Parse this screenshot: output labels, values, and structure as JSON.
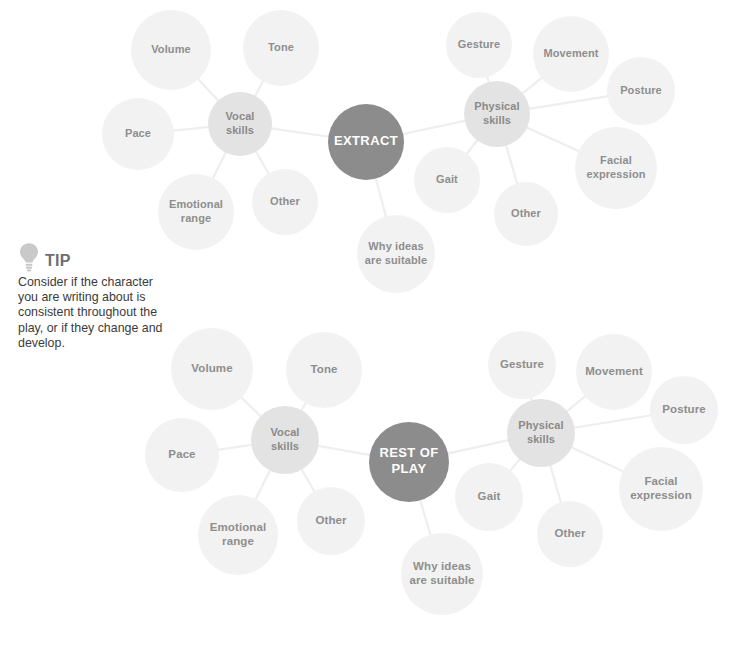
{
  "page": {
    "width": 734,
    "height": 648,
    "background": "#ffffff"
  },
  "colors": {
    "core_node": "#8c8c8c",
    "hub_node": "#e3e3e3",
    "leaf_node": "#f2f2f2",
    "edge_line": "#eeeeee",
    "node_text": "#8e8e8e",
    "core_text": "#ffffff",
    "tip_title": "#6f6f6f",
    "tip_body": "#3b3b3b",
    "tip_bulb": "#c9c9c9"
  },
  "tip": {
    "icon": "lightbulb-icon",
    "title": "TIP",
    "body": "Consider if the character you are writing about is consistent throughout the play, or if they change and develop."
  },
  "diagrams": [
    {
      "id": "extract-map",
      "name": "extract-mind-map",
      "core": {
        "label": "EXTRACT",
        "lines": [
          "EXTRACT"
        ],
        "cx": 366,
        "cy": 142,
        "r": 38,
        "font_size": 13
      },
      "hubs": [
        {
          "id": "vocal-skills-top",
          "label": "Vocal skills",
          "lines": [
            "Vocal",
            "skills"
          ],
          "cx": 240,
          "cy": 124,
          "r": 32,
          "font_size": 11
        },
        {
          "id": "physical-skills-top",
          "label": "Physical skills",
          "lines": [
            "Physical",
            "skills"
          ],
          "cx": 497,
          "cy": 114,
          "r": 33,
          "font_size": 11
        }
      ],
      "leaves": [
        {
          "id": "volume-top",
          "label": "Volume",
          "lines": [
            "Volume"
          ],
          "cx": 171,
          "cy": 50,
          "r": 40,
          "font_size": 11,
          "parent": "vocal-skills-top"
        },
        {
          "id": "tone-top",
          "label": "Tone",
          "lines": [
            "Tone"
          ],
          "cx": 281,
          "cy": 48,
          "r": 38,
          "font_size": 11,
          "parent": "vocal-skills-top"
        },
        {
          "id": "pace-top",
          "label": "Pace",
          "lines": [
            "Pace"
          ],
          "cx": 138,
          "cy": 134,
          "r": 36,
          "font_size": 11,
          "parent": "vocal-skills-top"
        },
        {
          "id": "emotional-range-top",
          "label": "Emotional range",
          "lines": [
            "Emotional",
            "range"
          ],
          "cx": 196,
          "cy": 212,
          "r": 38,
          "font_size": 11,
          "parent": "vocal-skills-top"
        },
        {
          "id": "other-vocal-top",
          "label": "Other",
          "lines": [
            "Other"
          ],
          "cx": 285,
          "cy": 202,
          "r": 33,
          "font_size": 11,
          "parent": "vocal-skills-top"
        },
        {
          "id": "gesture-top",
          "label": "Gesture",
          "lines": [
            "Gesture"
          ],
          "cx": 479,
          "cy": 45,
          "r": 33,
          "font_size": 11,
          "parent": "physical-skills-top"
        },
        {
          "id": "movement-top",
          "label": "Movement",
          "lines": [
            "Movement"
          ],
          "cx": 571,
          "cy": 54,
          "r": 38,
          "font_size": 11,
          "parent": "physical-skills-top"
        },
        {
          "id": "posture-top",
          "label": "Posture",
          "lines": [
            "Posture"
          ],
          "cx": 641,
          "cy": 91,
          "r": 34,
          "font_size": 11,
          "parent": "physical-skills-top"
        },
        {
          "id": "facial-expression-top",
          "label": "Facial expression",
          "lines": [
            "Facial",
            "expression"
          ],
          "cx": 616,
          "cy": 168,
          "r": 41,
          "font_size": 11,
          "parent": "physical-skills-top"
        },
        {
          "id": "gait-top",
          "label": "Gait",
          "lines": [
            "Gait"
          ],
          "cx": 447,
          "cy": 180,
          "r": 33,
          "font_size": 11,
          "parent": "physical-skills-top"
        },
        {
          "id": "other-physical-top",
          "label": "Other",
          "lines": [
            "Other"
          ],
          "cx": 526,
          "cy": 214,
          "r": 32,
          "font_size": 11,
          "parent": "physical-skills-top"
        },
        {
          "id": "why-ideas-top",
          "label": "Why ideas are suitable",
          "lines": [
            "Why ideas",
            "are suitable"
          ],
          "cx": 396,
          "cy": 254,
          "r": 39,
          "font_size": 11,
          "parent": "core"
        }
      ]
    },
    {
      "id": "rest-of-play-map",
      "name": "rest-of-play-mind-map",
      "core": {
        "label": "REST OF PLAY",
        "lines": [
          "REST OF",
          "PLAY"
        ],
        "cx": 409,
        "cy": 462,
        "r": 40,
        "font_size": 13
      },
      "hubs": [
        {
          "id": "vocal-skills-bottom",
          "label": "Vocal skills",
          "lines": [
            "Vocal",
            "skills"
          ],
          "cx": 285,
          "cy": 440,
          "r": 34,
          "font_size": 11
        },
        {
          "id": "physical-skills-bottom",
          "label": "Physical skills",
          "lines": [
            "Physical",
            "skills"
          ],
          "cx": 541,
          "cy": 433,
          "r": 34,
          "font_size": 11
        }
      ],
      "leaves": [
        {
          "id": "volume-bottom",
          "label": "Volume",
          "lines": [
            "Volume"
          ],
          "cx": 212,
          "cy": 369,
          "r": 41,
          "font_size": 11.5,
          "parent": "vocal-skills-bottom"
        },
        {
          "id": "tone-bottom",
          "label": "Tone",
          "lines": [
            "Tone"
          ],
          "cx": 324,
          "cy": 370,
          "r": 38,
          "font_size": 11.5,
          "parent": "vocal-skills-bottom"
        },
        {
          "id": "pace-bottom",
          "label": "Pace",
          "lines": [
            "Pace"
          ],
          "cx": 182,
          "cy": 455,
          "r": 37,
          "font_size": 11.5,
          "parent": "vocal-skills-bottom"
        },
        {
          "id": "emotional-range-bottom",
          "label": "Emotional range",
          "lines": [
            "Emotional",
            "range"
          ],
          "cx": 238,
          "cy": 535,
          "r": 40,
          "font_size": 11.5,
          "parent": "vocal-skills-bottom"
        },
        {
          "id": "other-vocal-bottom",
          "label": "Other",
          "lines": [
            "Other"
          ],
          "cx": 331,
          "cy": 521,
          "r": 34,
          "font_size": 11.5,
          "parent": "vocal-skills-bottom"
        },
        {
          "id": "gesture-bottom",
          "label": "Gesture",
          "lines": [
            "Gesture"
          ],
          "cx": 522,
          "cy": 365,
          "r": 34,
          "font_size": 11.5,
          "parent": "physical-skills-bottom"
        },
        {
          "id": "movement-bottom",
          "label": "Movement",
          "lines": [
            "Movement"
          ],
          "cx": 614,
          "cy": 372,
          "r": 38,
          "font_size": 11.5,
          "parent": "physical-skills-bottom"
        },
        {
          "id": "posture-bottom",
          "label": "Posture",
          "lines": [
            "Posture"
          ],
          "cx": 684,
          "cy": 410,
          "r": 34,
          "font_size": 11.5,
          "parent": "physical-skills-bottom"
        },
        {
          "id": "facial-expression-bottom",
          "label": "Facial expression",
          "lines": [
            "Facial",
            "expression"
          ],
          "cx": 661,
          "cy": 489,
          "r": 42,
          "font_size": 11.5,
          "parent": "physical-skills-bottom"
        },
        {
          "id": "gait-bottom",
          "label": "Gait",
          "lines": [
            "Gait"
          ],
          "cx": 489,
          "cy": 497,
          "r": 34,
          "font_size": 11.5,
          "parent": "physical-skills-bottom"
        },
        {
          "id": "other-bottom",
          "label": "Other",
          "lines": [
            "Other"
          ],
          "cx": 570,
          "cy": 534,
          "r": 33,
          "font_size": 11.5,
          "parent": "physical-skills-bottom"
        },
        {
          "id": "why-ideas-bottom",
          "label": "Why ideas are suitable",
          "lines": [
            "Why ideas",
            "are suitable"
          ],
          "cx": 442,
          "cy": 574,
          "r": 41,
          "font_size": 11.5,
          "parent": "core"
        }
      ]
    }
  ]
}
